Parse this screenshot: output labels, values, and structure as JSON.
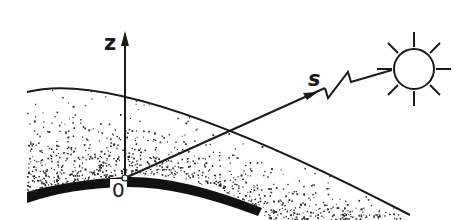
{
  "diagram": {
    "type": "atmospheric-geometry-schematic",
    "labels": {
      "vertical_axis": "z",
      "ray": "s",
      "origin": "0"
    },
    "elements": [
      {
        "name": "atmosphere-layer",
        "shape": "stippled arc band",
        "density": "dense near surface, sparse with altitude"
      },
      {
        "name": "earth-surface",
        "shape": "thick black arc"
      },
      {
        "name": "atmosphere-top-boundary",
        "shape": "thin arc"
      },
      {
        "name": "z-axis",
        "shape": "vertical arrow from origin"
      },
      {
        "name": "slant-path-ray",
        "shape": "arrow from origin toward sun with zigzag break"
      },
      {
        "name": "sun",
        "shape": "circle with 8 rays"
      }
    ],
    "colors": {
      "ink": "#1a1a1a",
      "background": "#ffffff"
    }
  }
}
